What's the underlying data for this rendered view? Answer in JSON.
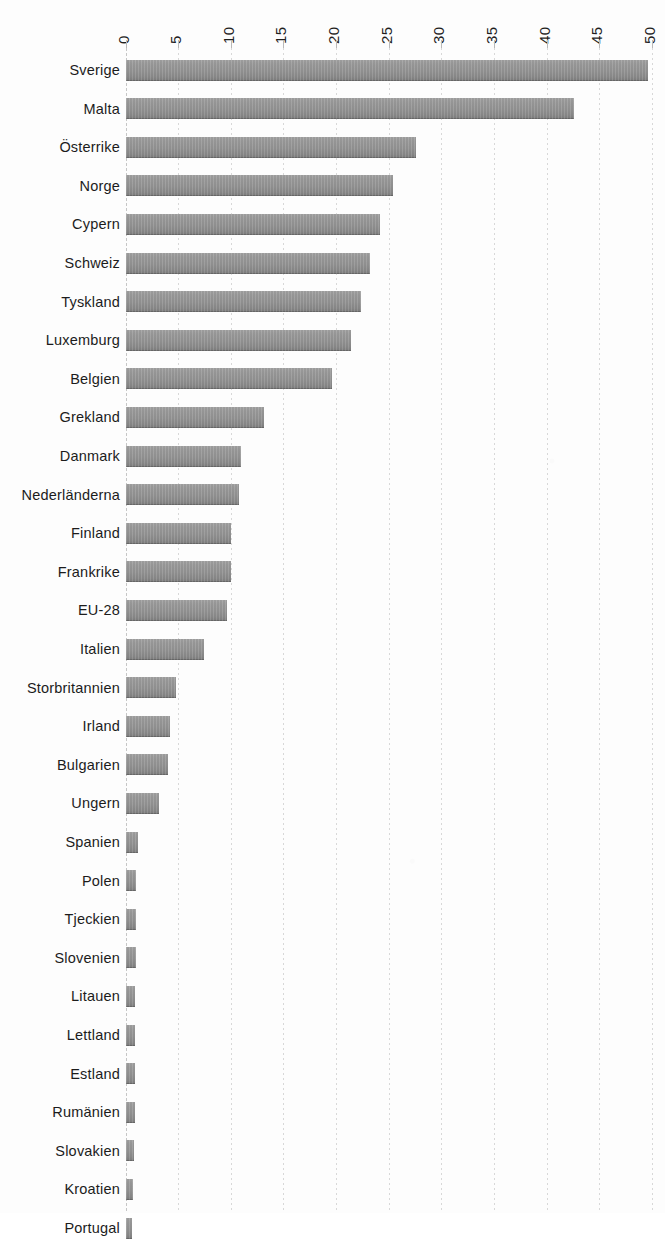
{
  "chart_data": {
    "type": "bar",
    "orientation": "horizontal",
    "title": "",
    "xlabel": "",
    "ylabel": "",
    "xlim": [
      0,
      50
    ],
    "ylim": null,
    "grid": true,
    "legend": null,
    "tick_labels": [
      "0",
      "5",
      "10",
      "15",
      "20",
      "25",
      "30",
      "35",
      "40",
      "45",
      "50"
    ],
    "ticks": [
      0,
      5,
      10,
      15,
      20,
      25,
      30,
      35,
      40,
      45,
      50
    ],
    "categories": [
      "Sverige",
      "Malta",
      "Österrike",
      "Norge",
      "Cypern",
      "Schweiz",
      "Tyskland",
      "Luxemburg",
      "Belgien",
      "Grekland",
      "Danmark",
      "Nederländerna",
      "Finland",
      "Frankrike",
      "EU-28",
      "Italien",
      "Storbritannien",
      "Irland",
      "Bulgarien",
      "Ungern",
      "Spanien",
      "Polen",
      "Tjeckien",
      "Slovenien",
      "Litauen",
      "Lettland",
      "Estland",
      "Rumänien",
      "Slovakien",
      "Kroatien",
      "Portugal"
    ],
    "values": [
      49.6,
      42.6,
      27.6,
      25.4,
      24.2,
      23.2,
      22.4,
      21.4,
      19.6,
      13.2,
      11.0,
      10.8,
      10.0,
      10.0,
      9.6,
      7.5,
      4.8,
      4.2,
      4.0,
      3.2,
      1.2,
      1.0,
      1.0,
      1.0,
      0.9,
      0.9,
      0.9,
      0.9,
      0.8,
      0.7,
      0.6
    ],
    "bar_color": "#939393",
    "gridline_color": "#d8d8d8",
    "background_color": "#fdfdfd"
  },
  "axis": {
    "tick_count": 11,
    "label_rotation_degrees": -90
  }
}
